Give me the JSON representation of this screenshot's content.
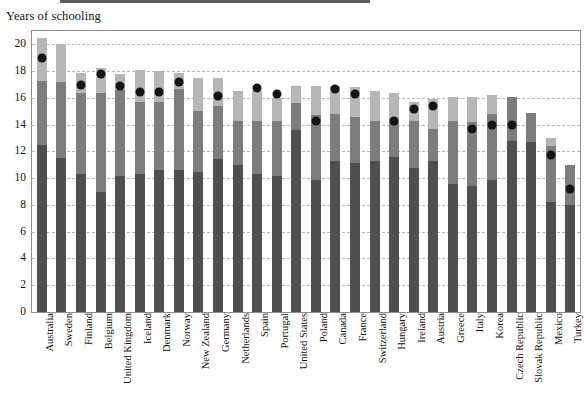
{
  "chart": {
    "title": "Years of schooling",
    "axis_label_y": "Years of schooling"
  },
  "chart_data": {
    "type": "bar",
    "subtype": "stacked-bar-with-marker",
    "title": "Years of schooling",
    "xlabel": "",
    "ylabel": "Years of schooling",
    "ylim": [
      0,
      21
    ],
    "yticks": [
      0,
      2,
      4,
      6,
      8,
      10,
      12,
      14,
      16,
      18,
      20
    ],
    "grid": true,
    "legend": "none",
    "categories": [
      "Australia",
      "Sweden",
      "Finland",
      "Belgium",
      "United Kingdom",
      "Iceland",
      "Denmark",
      "Norway",
      "New Zealand",
      "Germany",
      "Netherlands",
      "Spain",
      "Portugal",
      "United States",
      "Poland",
      "Canada",
      "France",
      "Switzerland",
      "Hungary",
      "Ireland",
      "Austria",
      "Greece",
      "Italy",
      "Korea",
      "Czech Republic",
      "Slovak Republic",
      "Mexico",
      "Turkey"
    ],
    "series": [
      {
        "name": "lower-segment",
        "color": "#4f4f4f",
        "values": [
          12.5,
          11.5,
          10.3,
          9.0,
          10.2,
          10.3,
          10.6,
          10.6,
          10.5,
          11.4,
          11.0,
          10.3,
          10.2,
          13.6,
          9.9,
          11.3,
          11.1,
          11.3,
          11.6,
          10.8,
          11.3,
          9.6,
          9.4,
          9.9,
          12.8,
          12.7,
          8.2,
          8.0
        ]
      },
      {
        "name": "middle-segment",
        "color": "#7d7d7d",
        "values": [
          4.8,
          5.7,
          6.1,
          7.4,
          6.4,
          5.4,
          5.1,
          6.1,
          4.5,
          4.0,
          3.3,
          4.0,
          4.1,
          2.0,
          4.8,
          3.5,
          3.5,
          3.0,
          2.6,
          3.5,
          2.4,
          4.7,
          4.8,
          4.9,
          3.3,
          2.2,
          4.2,
          3.0
        ]
      },
      {
        "name": "upper-segment",
        "color": "#b6b6b6",
        "values": [
          3.2,
          2.8,
          1.5,
          1.8,
          1.2,
          2.4,
          2.3,
          1.2,
          2.5,
          2.1,
          2.2,
          2.2,
          1.7,
          1.3,
          2.2,
          2.1,
          2.2,
          2.2,
          2.2,
          1.4,
          2.2,
          1.8,
          1.9,
          1.4,
          0.0,
          0.0,
          0.6,
          0.0
        ]
      },
      {
        "name": "marker",
        "type": "scatter",
        "color": "#141414",
        "values": [
          19.3,
          null,
          17.3,
          18.1,
          17.2,
          16.8,
          16.8,
          17.5,
          null,
          16.5,
          null,
          17.1,
          16.6,
          null,
          14.6,
          17.0,
          16.6,
          null,
          14.6,
          15.5,
          15.7,
          null,
          14.0,
          14.3,
          14.3,
          null,
          12.1,
          9.5
        ]
      }
    ]
  }
}
